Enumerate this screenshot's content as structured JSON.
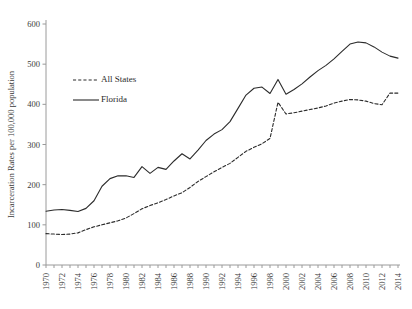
{
  "chart_data": {
    "type": "line",
    "title": "",
    "xlabel": "",
    "ylabel": "Incarceration Rates per 100,000 population",
    "xlim": [
      1970,
      2014
    ],
    "ylim": [
      0,
      600
    ],
    "ytick_step": 100,
    "xtick_step": 2,
    "grid": false,
    "legend_position": "upper-left-inside",
    "yticks": [
      0,
      100,
      200,
      300,
      400,
      500,
      600
    ],
    "ytick_labels": [
      "0",
      "100",
      "200",
      "300",
      "400",
      "500",
      "600"
    ],
    "x": [
      1970,
      1971,
      1972,
      1973,
      1974,
      1975,
      1976,
      1977,
      1978,
      1979,
      1980,
      1981,
      1982,
      1983,
      1984,
      1985,
      1986,
      1987,
      1988,
      1989,
      1990,
      1991,
      1992,
      1993,
      1994,
      1995,
      1996,
      1997,
      1998,
      1999,
      2000,
      2001,
      2002,
      2003,
      2004,
      2005,
      2006,
      2007,
      2008,
      2009,
      2010,
      2011,
      2012,
      2013,
      2014
    ],
    "xtick_labels": [
      "1970",
      "1972",
      "1974",
      "1976",
      "1978",
      "1980",
      "1982",
      "1984",
      "1986",
      "1988",
      "1990",
      "1992",
      "1994",
      "1996",
      "1998",
      "2000",
      "2002",
      "2004",
      "2006",
      "2008",
      "2010",
      "2012",
      "2014"
    ],
    "series": [
      {
        "name": "All States",
        "style": "dashed",
        "color": "#2b2b2b",
        "values": [
          78,
          77,
          76,
          77,
          80,
          88,
          95,
          100,
          105,
          110,
          117,
          128,
          140,
          148,
          155,
          163,
          172,
          180,
          193,
          208,
          220,
          232,
          243,
          253,
          268,
          283,
          293,
          302,
          315,
          405,
          376,
          379,
          383,
          387,
          391,
          396,
          403,
          408,
          412,
          411,
          408,
          402,
          399,
          428,
          428
        ]
      },
      {
        "name": "Florida",
        "style": "solid",
        "color": "#2b2b2b",
        "values": [
          134,
          137,
          138,
          136,
          133,
          141,
          160,
          196,
          215,
          222,
          222,
          218,
          245,
          228,
          243,
          238,
          259,
          277,
          264,
          286,
          310,
          326,
          337,
          357,
          390,
          423,
          440,
          443,
          427,
          462,
          425,
          437,
          451,
          468,
          484,
          497,
          513,
          532,
          550,
          555,
          553,
          543,
          530,
          520,
          515
        ]
      }
    ],
    "legend": [
      {
        "label": "All States",
        "style": "dashed"
      },
      {
        "label": "Florida",
        "style": "solid"
      }
    ]
  }
}
